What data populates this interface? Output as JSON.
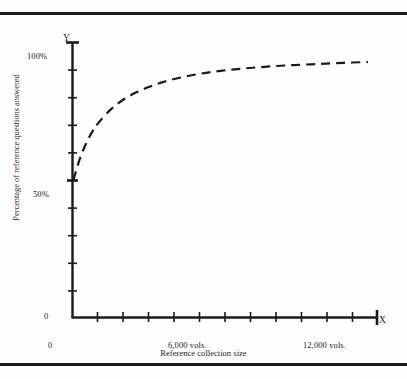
{
  "figure": {
    "has_top_rule": true,
    "has_bottom_rule": true,
    "rule_color": "#1a1a1a",
    "background": "#fdfdfd"
  },
  "axis_letters": {
    "y": "Y",
    "x": "X"
  },
  "labels": {
    "y_100": "100%",
    "y_50": "50%",
    "y_0": "0",
    "x_0": "0",
    "x_mid": "6,000 vols.",
    "x_max": "12,000 vols.",
    "y_title": "Percentage of reference questions answered",
    "x_title": "Reference collection size"
  },
  "chart_data": {
    "type": "line",
    "title": "",
    "xlabel": "Reference collection size",
    "ylabel": "Percentage of reference questions answered",
    "xlim": [
      0,
      12000
    ],
    "ylim": [
      0,
      100
    ],
    "xtick_labels": [
      "0",
      "6,000 vols.",
      "12,000 vols."
    ],
    "xtick_values": [
      0,
      6000,
      12000
    ],
    "ytick_labels": [
      "0",
      "50%",
      "100%"
    ],
    "ytick_values": [
      0,
      50,
      100
    ],
    "x_minor_tick_count": 12,
    "y_minor_tick_count": 10,
    "grid": false,
    "legend": false,
    "line_style": "dashed",
    "line_color": "#1a1a1a",
    "line_width": 2.2,
    "series": [
      {
        "name": "Percentage of reference questions answered",
        "x": [
          0,
          250,
          500,
          750,
          1000,
          1500,
          2000,
          2500,
          3000,
          3500,
          4000,
          5000,
          6000,
          7000,
          8000,
          9000,
          10000,
          11000,
          12000
        ],
        "values": [
          50.0,
          57.5,
          63.0,
          67.3,
          70.6,
          75.5,
          79.0,
          81.6,
          83.6,
          85.2,
          86.5,
          88.4,
          89.7,
          90.6,
          91.3,
          91.8,
          92.2,
          92.6,
          92.9
        ]
      }
    ],
    "annotation": "Asymptotic diminishing-returns curve rising from 50% at zero volumes toward about 93% at 12,000 volumes."
  }
}
